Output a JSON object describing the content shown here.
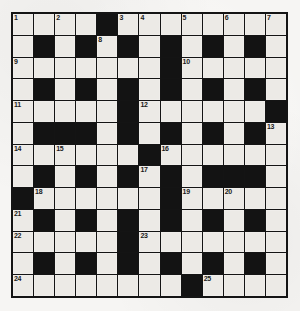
{
  "puzzle": {
    "title": "Crossword Grid",
    "type": "crossword",
    "rows": 13,
    "cols": 13,
    "colors": {
      "block": "#131313",
      "cell": "#eceae6",
      "border": "#141414",
      "number": "#1a1a1a",
      "paper": "#f6f5f3"
    },
    "legend": {
      "white_cell": "open-square",
      "black_cell": "block-square"
    },
    "grid": [
      [
        "w",
        "w",
        "w",
        "w",
        "b",
        "w",
        "w",
        "w",
        "w",
        "w",
        "w",
        "w",
        "w"
      ],
      [
        "w",
        "b",
        "w",
        "b",
        "w",
        "b",
        "w",
        "b",
        "w",
        "b",
        "w",
        "b",
        "w"
      ],
      [
        "w",
        "w",
        "w",
        "w",
        "w",
        "w",
        "w",
        "b",
        "w",
        "w",
        "w",
        "w",
        "w"
      ],
      [
        "w",
        "b",
        "w",
        "b",
        "w",
        "b",
        "w",
        "b",
        "w",
        "b",
        "w",
        "b",
        "w"
      ],
      [
        "w",
        "w",
        "w",
        "w",
        "w",
        "b",
        "w",
        "w",
        "w",
        "w",
        "w",
        "w",
        "b"
      ],
      [
        "w",
        "b",
        "b",
        "b",
        "w",
        "b",
        "w",
        "b",
        "w",
        "b",
        "w",
        "b",
        "w"
      ],
      [
        "w",
        "w",
        "w",
        "w",
        "w",
        "w",
        "b",
        "w",
        "w",
        "w",
        "w",
        "w",
        "w"
      ],
      [
        "w",
        "b",
        "w",
        "b",
        "w",
        "b",
        "w",
        "b",
        "w",
        "b",
        "b",
        "b",
        "w"
      ],
      [
        "b",
        "w",
        "w",
        "w",
        "w",
        "w",
        "w",
        "b",
        "w",
        "w",
        "w",
        "w",
        "w"
      ],
      [
        "w",
        "b",
        "w",
        "b",
        "w",
        "b",
        "w",
        "b",
        "w",
        "b",
        "w",
        "b",
        "w"
      ],
      [
        "w",
        "w",
        "w",
        "w",
        "w",
        "b",
        "w",
        "w",
        "w",
        "w",
        "w",
        "w",
        "w"
      ],
      [
        "w",
        "b",
        "w",
        "b",
        "w",
        "b",
        "w",
        "b",
        "w",
        "b",
        "w",
        "b",
        "w"
      ],
      [
        "w",
        "w",
        "w",
        "w",
        "w",
        "w",
        "w",
        "w",
        "b",
        "w",
        "w",
        "w",
        "w"
      ]
    ],
    "numbers": [
      {
        "row": 0,
        "col": 0,
        "label": "1"
      },
      {
        "row": 0,
        "col": 2,
        "label": "2"
      },
      {
        "row": 0,
        "col": 5,
        "label": "3"
      },
      {
        "row": 0,
        "col": 6,
        "label": "4"
      },
      {
        "row": 0,
        "col": 8,
        "label": "5"
      },
      {
        "row": 0,
        "col": 10,
        "label": "6"
      },
      {
        "row": 0,
        "col": 12,
        "label": "7"
      },
      {
        "row": 1,
        "col": 4,
        "label": "8"
      },
      {
        "row": 2,
        "col": 0,
        "label": "9"
      },
      {
        "row": 2,
        "col": 8,
        "label": "10"
      },
      {
        "row": 4,
        "col": 0,
        "label": "11"
      },
      {
        "row": 4,
        "col": 6,
        "label": "12"
      },
      {
        "row": 5,
        "col": 12,
        "label": "13"
      },
      {
        "row": 6,
        "col": 0,
        "label": "14"
      },
      {
        "row": 6,
        "col": 2,
        "label": "15"
      },
      {
        "row": 6,
        "col": 7,
        "label": "16"
      },
      {
        "row": 7,
        "col": 6,
        "label": "17"
      },
      {
        "row": 8,
        "col": 1,
        "label": "18"
      },
      {
        "row": 8,
        "col": 8,
        "label": "19"
      },
      {
        "row": 8,
        "col": 10,
        "label": "20"
      },
      {
        "row": 9,
        "col": 0,
        "label": "21"
      },
      {
        "row": 10,
        "col": 0,
        "label": "22"
      },
      {
        "row": 10,
        "col": 6,
        "label": "23"
      },
      {
        "row": 12,
        "col": 0,
        "label": "24"
      },
      {
        "row": 12,
        "col": 9,
        "label": "25"
      }
    ]
  }
}
